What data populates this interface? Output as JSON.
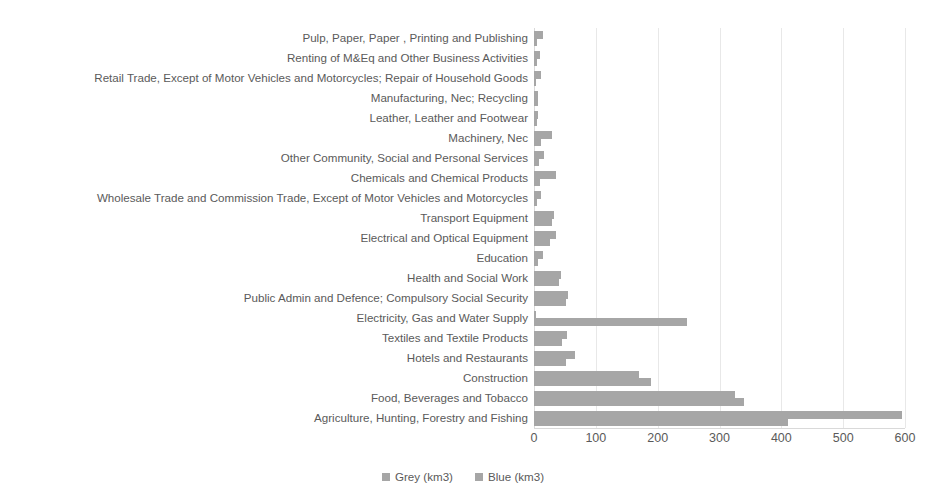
{
  "chart_data": {
    "type": "bar",
    "orientation": "horizontal",
    "title": "",
    "xlabel": "",
    "ylabel": "",
    "xlim": [
      0,
      600
    ],
    "xticks": [
      0,
      100,
      200,
      300,
      400,
      500,
      600
    ],
    "xtick_labels": [
      "0",
      "100",
      "200",
      "300",
      "400",
      "500",
      "600"
    ],
    "grid": true,
    "grid_axis": "x",
    "legend_position": "bottom-center",
    "categories": [
      "Pulp, Paper, Paper , Printing and Publishing",
      "Renting of M&Eq and Other Business Activities",
      "Retail Trade, Except of Motor Vehicles and Motorcycles; Repair of Household Goods",
      "Manufacturing, Nec; Recycling",
      "Leather, Leather and Footwear",
      "Machinery, Nec",
      "Other Community, Social and Personal Services",
      "Chemicals and Chemical Products",
      "Wholesale Trade and Commission Trade, Except of Motor Vehicles and Motorcycles",
      "Transport Equipment",
      "Electrical and Optical Equipment",
      "Education",
      "Health and Social Work",
      "Public Admin and Defence; Compulsory Social Security",
      "Electricity, Gas and Water Supply",
      "Textiles and Textile Products",
      "Hotels and Restaurants",
      "Construction",
      "Food, Beverages and Tobacco",
      "Agriculture, Hunting, Forestry and Fishing"
    ],
    "series": [
      {
        "name": "Grey (km3)",
        "color": "#a6a6a6",
        "values": [
          14,
          10,
          12,
          7,
          6,
          29,
          16,
          35,
          12,
          33,
          36,
          14,
          44,
          55,
          4,
          54,
          67,
          170,
          325,
          595
        ]
      },
      {
        "name": "Blue (km3)",
        "color": "#a6a6a6",
        "values": [
          5,
          5,
          4,
          6,
          5,
          11,
          8,
          10,
          5,
          29,
          26,
          6,
          40,
          52,
          248,
          46,
          52,
          189,
          340,
          410
        ]
      }
    ]
  },
  "legend": {
    "items": [
      {
        "label": "Grey (km3)",
        "color": "#a6a6a6"
      },
      {
        "label": "Blue (km3)",
        "color": "#a6a6a6"
      }
    ]
  }
}
